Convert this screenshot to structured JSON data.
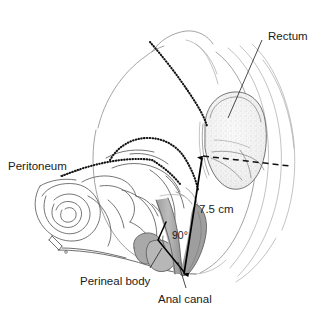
{
  "figure": {
    "background_color": "#ffffff",
    "width": 324,
    "height": 319
  },
  "labels": {
    "rectum": "Rectum",
    "peritoneum": "Peritoneum",
    "perineal_body": "Perineal body",
    "anal_canal": "Anal canal"
  },
  "measurements": {
    "length": "7.5 cm",
    "angle": "90°"
  },
  "colors": {
    "text": "#1b1b1b",
    "outline": "#4a4a4a",
    "outline_soft": "#7d7d7d",
    "muscle_fill": "#a9a9a9",
    "peritoneum": "#111111",
    "measure": "#000000"
  },
  "annotation_list": [
    {
      "name": "rectum",
      "text": "Rectum",
      "kind": "organ-label"
    },
    {
      "name": "peritoneum",
      "text": "Peritoneum",
      "kind": "membrane-label"
    },
    {
      "name": "perineal-body",
      "text": "Perineal body",
      "kind": "structure-label"
    },
    {
      "name": "anal-canal",
      "text": "Anal canal",
      "kind": "organ-label"
    },
    {
      "name": "length-measure",
      "text": "7.5 cm",
      "kind": "measurement"
    },
    {
      "name": "anorectal-angle",
      "text": "90°",
      "kind": "measurement"
    }
  ]
}
